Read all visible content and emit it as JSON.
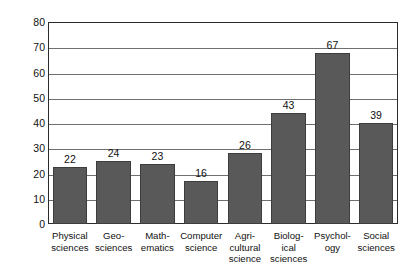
{
  "chart_data": {
    "type": "bar",
    "title": "",
    "xlabel": "",
    "ylabel": "Percent",
    "ylim": [
      0,
      80
    ],
    "yticks": [
      0,
      10,
      20,
      30,
      40,
      50,
      60,
      70,
      80
    ],
    "grid": true,
    "legend": "none",
    "bar_color": "#595959",
    "categories": [
      "Physical sciences",
      "Geosciences",
      "Mathematics",
      "Computer science",
      "Agricultural science",
      "Biological sciences",
      "Psychology",
      "Social sciences"
    ],
    "category_lines": [
      [
        "Physical",
        "sciences"
      ],
      [
        "Geo-",
        "sciences"
      ],
      [
        "Math-",
        "ematics"
      ],
      [
        "Computer",
        "science"
      ],
      [
        "Agri-",
        "cultural",
        "science"
      ],
      [
        "Biolog-",
        "ical",
        "sciences"
      ],
      [
        "Psychol-",
        "ogy"
      ],
      [
        "Social",
        "sciences"
      ]
    ],
    "values": [
      22,
      24,
      23,
      16,
      26,
      43,
      67,
      39
    ],
    "value_labels": [
      "22",
      "24",
      "23",
      "16",
      "26",
      "43",
      "67",
      "39"
    ]
  }
}
